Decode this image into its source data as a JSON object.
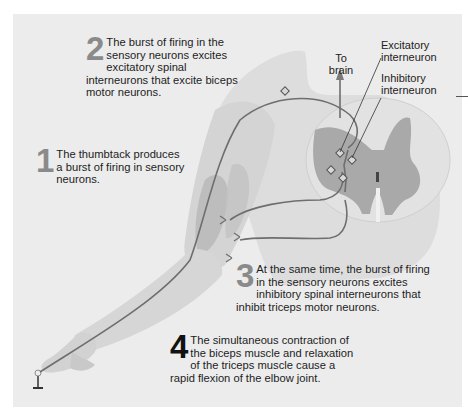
{
  "figure": {
    "steps": [
      {
        "number": "1",
        "text": "The thumbtack produces a burst of firing in sensory neurons."
      },
      {
        "number": "2",
        "text": "The burst of firing in the sensory neurons excites excitatory spinal interneurons that excite biceps motor neurons."
      },
      {
        "number": "3",
        "text": "At the same time, the burst of firing in the sensory neurons excites inhibitory spinal interneurons that inhibit triceps motor neurons."
      },
      {
        "number": "4",
        "text": "The simultaneous contraction of the biceps muscle and relaxation of the triceps muscle cause a rapid flexion of the elbow joint."
      }
    ],
    "labels": {
      "to_brain_line1": "To",
      "to_brain_line2": "brain",
      "excitatory_line1": "Excitatory",
      "excitatory_line2": "interneuron",
      "inhibitory_line1": "Inhibitory",
      "inhibitory_line2": "interneuron"
    },
    "colors": {
      "panel_bg": "#ececec",
      "skin": "#d9d9d9",
      "muscle": "#b5b5b5",
      "nerve": "#6e6e6e",
      "gray_matter": "#a9a9a9",
      "step_number_gray": "#8a8a8a",
      "step_number_black": "#111111"
    }
  }
}
